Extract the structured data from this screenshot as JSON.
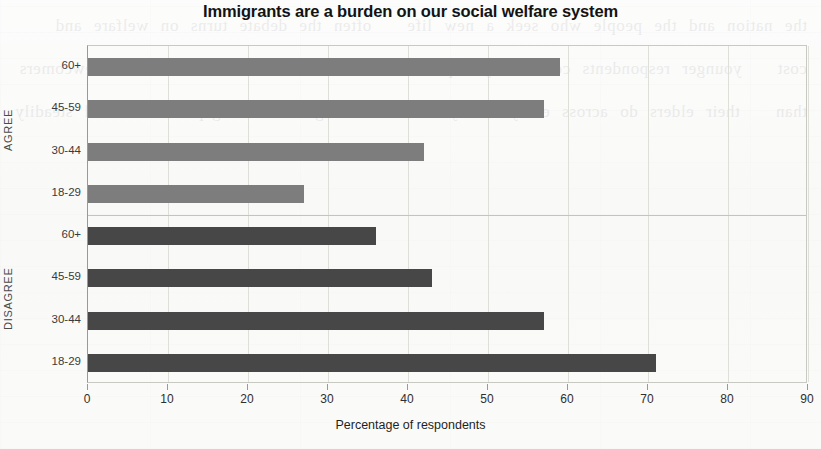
{
  "chart_data": {
    "type": "bar",
    "orientation": "horizontal",
    "title": "Immigrants are a burden on our social welfare system",
    "xlabel": "Percentage of respondents",
    "ylabel": "",
    "xlim": [
      0,
      90
    ],
    "xticks": [
      0,
      10,
      20,
      30,
      40,
      50,
      60,
      70,
      80,
      90
    ],
    "grid": true,
    "legend": "none",
    "panels": [
      {
        "name": "AGREE",
        "color": "#7d7d7d",
        "categories": [
          "60+",
          "45-59",
          "30-44",
          "18-29"
        ],
        "values": [
          59,
          57,
          42,
          27
        ]
      },
      {
        "name": "DISAGREE",
        "color": "#474747",
        "categories": [
          "60+",
          "45-59",
          "30-44",
          "18-29"
        ],
        "values": [
          36,
          43,
          57,
          71
        ]
      }
    ],
    "categories": [
      "60+",
      "45-59",
      "30-44",
      "18-29"
    ],
    "series": [
      {
        "name": "AGREE",
        "values": [
          59,
          57,
          42,
          27
        ]
      },
      {
        "name": "DISAGREE",
        "values": [
          36,
          43,
          57,
          71
        ]
      }
    ]
  },
  "colors": {
    "agree_bar": "#7d7d7d",
    "disagree_bar": "#474747",
    "axis": "#9a9a95",
    "grid": "#dfdfda",
    "text": "#2b2b2b",
    "background": "#fbfbfa"
  },
  "ghost_text": "the nation and the people who seek a new life   often the debate turns on welfare and cost   younger respondents consistently express more   favourable attitudes toward newcomers than   their elders do across every survey wave   this generational gap has widened steadily"
}
